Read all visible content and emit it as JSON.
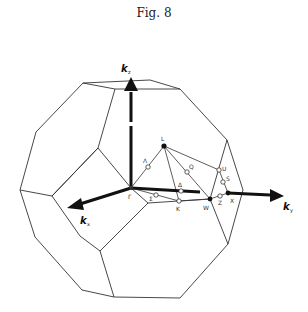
{
  "figure": {
    "title": "Fig. 8",
    "axes": {
      "kx": {
        "letter": "k",
        "sub": "x"
      },
      "ky": {
        "letter": "k",
        "sub": "y"
      },
      "kz": {
        "letter": "k",
        "sub": "z"
      }
    },
    "points": {
      "gamma": "Γ",
      "L": "L",
      "K": "K",
      "W": "W",
      "X": "X",
      "U": "U",
      "S": "S",
      "Z": "Z",
      "Q": "Q",
      "Lambda": "Λ",
      "Delta": "Δ",
      "Sigma": "Σ"
    }
  }
}
